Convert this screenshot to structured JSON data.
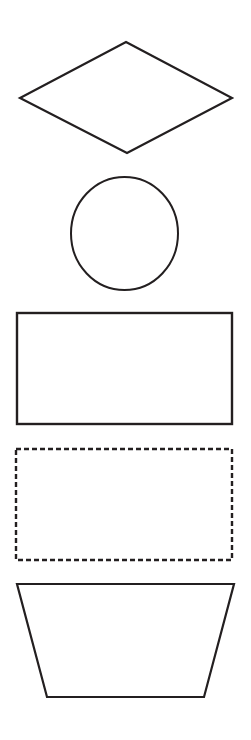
{
  "page": {
    "width": 251,
    "height": 740,
    "background_color": "#ffffff",
    "stroke_color": "#231f20"
  },
  "shapes": [
    {
      "id": "diamond",
      "name": "diamond",
      "label": "Diamond",
      "kind": "polygon",
      "stroke_style": "solid",
      "stroke_width": 2.2,
      "stroke_color": "#231f20",
      "fill_color": "#ffffff",
      "points": "126,42 232,98 127,153 20,98",
      "bounds": {
        "x": 20,
        "y": 42,
        "width": 212,
        "height": 111
      }
    },
    {
      "id": "circle",
      "name": "circle",
      "label": "Circle",
      "kind": "ellipse",
      "stroke_style": "solid",
      "stroke_width": 2.0,
      "stroke_color": "#231f20",
      "fill_color": "#ffffff",
      "center_x": 124.5,
      "center_y": 233.5,
      "radius_x": 53.5,
      "radius_y": 56.5,
      "bounds": {
        "x": 71,
        "y": 177,
        "width": 107,
        "height": 113
      }
    },
    {
      "id": "rectangle-solid",
      "name": "solid-rectangle",
      "label": "Rectangle",
      "kind": "rect",
      "stroke_style": "solid",
      "stroke_width": 2.4,
      "stroke_color": "#231f20",
      "fill_color": "#ffffff",
      "bounds": {
        "x": 17,
        "y": 313,
        "width": 215,
        "height": 111
      }
    },
    {
      "id": "rectangle-dashed",
      "name": "dashed-rectangle",
      "label": "Dashed Rectangle",
      "kind": "rect",
      "stroke_style": "dashed",
      "stroke_width": 2.4,
      "stroke_dasharray": "5 3",
      "stroke_color": "#231f20",
      "fill_color": "#ffffff",
      "bounds": {
        "x": 16,
        "y": 449,
        "width": 216,
        "height": 111
      }
    },
    {
      "id": "trapezoid",
      "name": "trapezoid",
      "label": "Trapezoid",
      "kind": "polygon",
      "stroke_style": "solid",
      "stroke_width": 2.2,
      "stroke_color": "#231f20",
      "fill_color": "#ffffff",
      "points": "17,584 234,584 204,697 47,697",
      "bounds": {
        "x": 17,
        "y": 584,
        "width": 217,
        "height": 113
      }
    }
  ]
}
